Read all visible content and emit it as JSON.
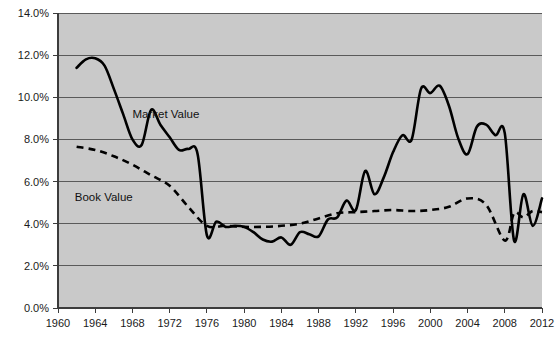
{
  "chart_data": {
    "type": "line",
    "title": "",
    "subtitle": "",
    "xlabel": "",
    "ylabel": "",
    "xlim": [
      1960,
      2012
    ],
    "ylim": [
      0.0,
      14.0
    ],
    "grid": true,
    "legend_position": "inline-annotations",
    "x_tick_labels": [
      "1960",
      "1964",
      "1968",
      "1972",
      "1976",
      "1980",
      "1984",
      "1988",
      "1992",
      "1996",
      "2000",
      "2004",
      "2008",
      "2012"
    ],
    "x_ticks": [
      1960,
      1964,
      1968,
      1972,
      1976,
      1980,
      1984,
      1988,
      1992,
      1996,
      2000,
      2004,
      2008,
      2012
    ],
    "y_tick_labels": [
      "0.0%",
      "2.0%",
      "4.0%",
      "6.0%",
      "8.0%",
      "10.0%",
      "12.0%",
      "14.0%"
    ],
    "y_ticks": [
      0.0,
      2.0,
      4.0,
      6.0,
      8.0,
      10.0,
      12.0,
      14.0
    ],
    "annotations": [
      {
        "name": "market-value-label",
        "text": "Market Value",
        "x": 1968.0,
        "y": 9.0
      },
      {
        "name": "book-value-label",
        "text": "Book Value",
        "x": 1961.8,
        "y": 5.1
      }
    ],
    "series": [
      {
        "name": "Market Value",
        "style": "solid",
        "color": "#000000",
        "x": [
          1962,
          1963,
          1964,
          1965,
          1966,
          1967,
          1968,
          1969,
          1970,
          1971,
          1972,
          1973,
          1974,
          1975,
          1976,
          1977,
          1978,
          1979,
          1980,
          1981,
          1982,
          1983,
          1984,
          1985,
          1986,
          1987,
          1988,
          1989,
          1990,
          1991,
          1992,
          1993,
          1994,
          1995,
          1996,
          1997,
          1998,
          1999,
          2000,
          2001,
          2002,
          2003,
          2004,
          2005,
          2006,
          2007,
          2008,
          2009,
          2010,
          2011,
          2012
        ],
        "values": [
          11.4,
          11.8,
          11.85,
          11.5,
          10.4,
          9.2,
          8.0,
          7.75,
          9.4,
          8.7,
          8.1,
          7.5,
          7.55,
          7.3,
          3.45,
          4.1,
          3.85,
          3.9,
          3.85,
          3.6,
          3.25,
          3.15,
          3.35,
          3.0,
          3.6,
          3.5,
          3.4,
          4.2,
          4.3,
          5.1,
          4.65,
          6.5,
          5.4,
          6.2,
          7.4,
          8.2,
          8.0,
          10.4,
          10.2,
          10.55,
          9.6,
          8.05,
          7.3,
          8.6,
          8.7,
          8.2,
          8.3,
          3.2,
          5.4,
          3.9,
          5.2
        ],
        "description": "Market value series peaks near 11.9% in 1964, drops to ~3.4% in 1976, rises to ~10.5% around 1999-2001, crashes to ~3.2% in 2009"
      },
      {
        "name": "Book Value",
        "style": "dashed",
        "color": "#000000",
        "x": [
          1962,
          1964,
          1966,
          1968,
          1970,
          1972,
          1974,
          1976,
          1978,
          1980,
          1982,
          1984,
          1986,
          1988,
          1990,
          1992,
          1994,
          1996,
          1998,
          2000,
          2002,
          2004,
          2006,
          2008,
          2009,
          2010,
          2011,
          2012
        ],
        "values": [
          7.65,
          7.5,
          7.2,
          6.8,
          6.3,
          5.8,
          4.8,
          3.9,
          3.9,
          3.85,
          3.85,
          3.9,
          4.0,
          4.25,
          4.5,
          4.55,
          4.6,
          4.65,
          4.6,
          4.65,
          4.8,
          5.2,
          4.9,
          3.2,
          4.5,
          4.3,
          4.6,
          4.55
        ],
        "description": "Book value series declines steadily from ~7.7% in 1962 to ~3.9% by 1976, then flat around 4-5%, dips to ~3.2% in 2008"
      }
    ]
  },
  "axes": {
    "y_axis_name": "percent-axis",
    "x_axis_name": "year-axis"
  }
}
